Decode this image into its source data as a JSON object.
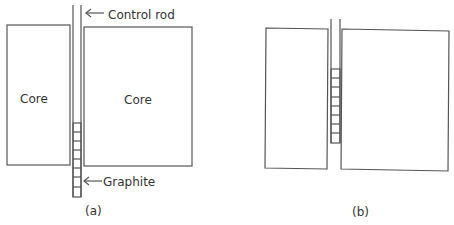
{
  "panels": {
    "a": {
      "caption": "(a)",
      "left_core_label": "Core",
      "right_core_label": "Core",
      "control_rod_label": "Control rod",
      "graphite_label": "Graphite"
    },
    "b": {
      "caption": "(b)"
    }
  },
  "colors": {
    "stroke": "#555555",
    "text": "#333333",
    "background": "#ffffff"
  }
}
